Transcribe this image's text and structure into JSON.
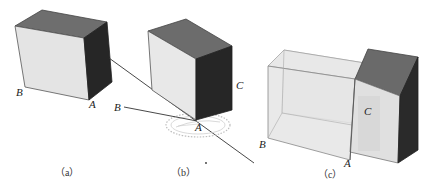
{
  "figure": {
    "panels": [
      {
        "id": "a",
        "caption": "（a）",
        "labels": {
          "B": "B",
          "A": "A"
        }
      },
      {
        "id": "b",
        "caption": "（b）",
        "labels": {
          "B": "B",
          "A": "A",
          "C": "C"
        }
      },
      {
        "id": "c",
        "caption": "（c）",
        "labels": {
          "B": "B",
          "A": "A",
          "C": "C"
        }
      }
    ],
    "colors": {
      "top_face": "#6e6e6e",
      "light_face": "#e6e6e6",
      "dark_face": "#2a2a2a",
      "transparent_face": "#ececec",
      "edge": "#3a3a3a",
      "background": "#ffffff"
    }
  }
}
